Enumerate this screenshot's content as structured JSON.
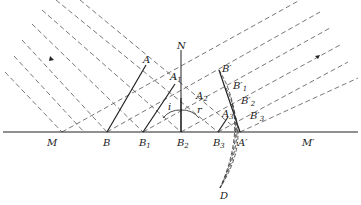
{
  "diagram": {
    "colors": {
      "ink": "#222222",
      "dash": "#555555",
      "background": "#ffffff"
    },
    "labels": {
      "normal": "N",
      "mirror_left": "M",
      "mirror_right": "M′",
      "A": "A",
      "A1": "A",
      "A1_sub": "1",
      "A2": "A",
      "A2_sub": "2",
      "A3": "A",
      "A3_sub": "3",
      "B": "B",
      "B1": "B",
      "B1_sub": "1",
      "B2": "B",
      "B2_sub": "2",
      "B3": "B",
      "B3_sub": "3",
      "A_prime": "A′",
      "B_prime": "B′",
      "B1_prime": "B′",
      "B1_prime_sub": "1",
      "B2_prime": "B′",
      "B2_prime_sub": "2",
      "B3_prime": "B′",
      "B3_prime_sub": "3",
      "D": "D",
      "angle_incidence": "i",
      "angle_reflection": "r"
    }
  }
}
